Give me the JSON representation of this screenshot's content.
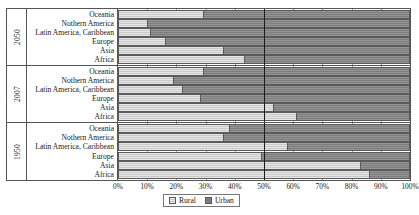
{
  "chart_data": {
    "type": "bar",
    "subtype": "stacked-horizontal-100pct",
    "title": "",
    "xlabel": "",
    "ylabel": "",
    "xlim": [
      0,
      100
    ],
    "grid": true,
    "legend_position": "bottom-center",
    "x_tick_labels": [
      "0%",
      "10%",
      "20%",
      "30%",
      "40%",
      "50%",
      "60%",
      "70%",
      "80%",
      "90%",
      "100%"
    ],
    "x_tick_values": [
      0,
      10,
      20,
      30,
      40,
      50,
      60,
      70,
      80,
      90,
      100
    ],
    "series": [
      {
        "name": "Rural",
        "color": "#c9c9c9"
      },
      {
        "name": "Urban",
        "color": "#7d7d7d"
      }
    ],
    "categories": [
      "Oceania",
      "Nothern America",
      "Latin America, Caribbean",
      "Europe",
      "Asia",
      "Africa"
    ],
    "groups": [
      {
        "label": "2050",
        "rows": [
          {
            "category": "Oceania",
            "rural": 29,
            "urban": 71
          },
          {
            "category": "Nothern America",
            "rural": 10,
            "urban": 90
          },
          {
            "category": "Latin America, Caribbean",
            "rural": 11,
            "urban": 89
          },
          {
            "category": "Europe",
            "rural": 16,
            "urban": 84
          },
          {
            "category": "Asia",
            "rural": 36,
            "urban": 64
          },
          {
            "category": "Africa",
            "rural": 43,
            "urban": 57
          }
        ]
      },
      {
        "label": "2007",
        "rows": [
          {
            "category": "Oceania",
            "rural": 29,
            "urban": 71
          },
          {
            "category": "Nothern America",
            "rural": 19,
            "urban": 81
          },
          {
            "category": "Latin America, Caribbean",
            "rural": 22,
            "urban": 78
          },
          {
            "category": "Europe",
            "rural": 28,
            "urban": 72
          },
          {
            "category": "Asia",
            "rural": 53,
            "urban": 47
          },
          {
            "category": "Africa",
            "rural": 61,
            "urban": 39
          }
        ]
      },
      {
        "label": "1950",
        "rows": [
          {
            "category": "Oceania",
            "rural": 38,
            "urban": 62
          },
          {
            "category": "Nothern America",
            "rural": 36,
            "urban": 64
          },
          {
            "category": "Latin America, Caribbean",
            "rural": 58,
            "urban": 42
          },
          {
            "category": "Europe",
            "rural": 49,
            "urban": 51
          },
          {
            "category": "Asia",
            "rural": 83,
            "urban": 17
          },
          {
            "category": "Africa",
            "rural": 86,
            "urban": 14
          }
        ]
      }
    ]
  },
  "legend": {
    "items": [
      {
        "label": "Rural",
        "key": "rural"
      },
      {
        "label": "Urban",
        "key": "urban"
      }
    ]
  }
}
